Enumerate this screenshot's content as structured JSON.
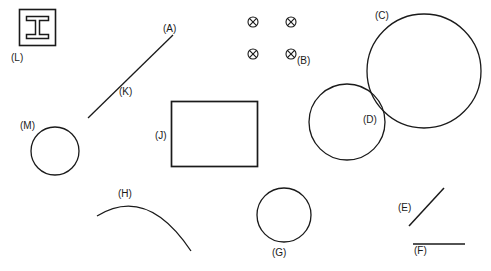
{
  "figure": {
    "background_color": "#ffffff",
    "stroke_color": "#1a1a1a",
    "width": 491,
    "height": 271,
    "labels": [
      {
        "id": "A",
        "text": "(A)",
        "x": 163,
        "y": 24,
        "target": "line-K-upper-end"
      },
      {
        "id": "B",
        "text": "(B)",
        "x": 297,
        "y": 56,
        "target": "crossed-circle-marker-group"
      },
      {
        "id": "C",
        "text": "(C)",
        "x": 375,
        "y": 11,
        "target": "large-circle"
      },
      {
        "id": "D",
        "text": "(D)",
        "x": 363,
        "y": 115,
        "target": "medium-circle"
      },
      {
        "id": "E",
        "text": "(E)",
        "x": 398,
        "y": 203,
        "target": "diagonal-line-short"
      },
      {
        "id": "F",
        "text": "(F)",
        "x": 414,
        "y": 246,
        "target": "horizontal-line"
      },
      {
        "id": "G",
        "text": "(G)",
        "x": 272,
        "y": 248,
        "target": "small-circle-bottom"
      },
      {
        "id": "H",
        "text": "(H)",
        "x": 118,
        "y": 189,
        "target": "open-arc"
      },
      {
        "id": "J",
        "text": "(J)",
        "x": 155,
        "y": 131,
        "target": "rectangle"
      },
      {
        "id": "K",
        "text": "(K)",
        "x": 119,
        "y": 87,
        "target": "diagonal-line-long"
      },
      {
        "id": "L",
        "text": "(L)",
        "x": 11,
        "y": 53,
        "target": "square-with-ibeam"
      },
      {
        "id": "M",
        "text": "(M)",
        "x": 20,
        "y": 121,
        "target": "small-circle-left"
      }
    ],
    "shapes": [
      {
        "name": "square-with-ibeam",
        "type": "square-outline-with-inner-ibeam",
        "x": 19,
        "y": 9,
        "width": 37,
        "height": 37
      },
      {
        "name": "diagonal-line-long",
        "type": "line",
        "x1": 88,
        "y1": 118,
        "x2": 173,
        "y2": 35
      },
      {
        "name": "crossed-circle-marker-group",
        "type": "marker-grid",
        "rows": 2,
        "cols": 2,
        "positions": [
          [
            253,
            22
          ],
          [
            291,
            22
          ],
          [
            253,
            54
          ],
          [
            291,
            54
          ]
        ],
        "marker": "circle-with-x"
      },
      {
        "name": "large-circle",
        "type": "circle",
        "cx": 424,
        "cy": 71,
        "r": 57
      },
      {
        "name": "medium-circle",
        "type": "circle",
        "cx": 347,
        "cy": 122,
        "r": 38
      },
      {
        "name": "rectangle",
        "type": "rect",
        "x": 171,
        "y": 101,
        "width": 87,
        "height": 66
      },
      {
        "name": "small-circle-left",
        "type": "circle",
        "cx": 55,
        "cy": 151,
        "r": 24
      },
      {
        "name": "small-circle-bottom",
        "type": "circle",
        "cx": 284,
        "cy": 215,
        "r": 27
      },
      {
        "name": "open-arc",
        "type": "arc",
        "start": [
          97,
          216
        ],
        "control": [
          150,
          188
        ],
        "end": [
          191,
          251
        ]
      },
      {
        "name": "diagonal-line-short",
        "type": "line",
        "x1": 409,
        "y1": 226,
        "x2": 444,
        "y2": 188
      },
      {
        "name": "horizontal-line",
        "type": "line",
        "x1": 413,
        "y1": 244,
        "x2": 465,
        "y2": 244
      }
    ]
  }
}
